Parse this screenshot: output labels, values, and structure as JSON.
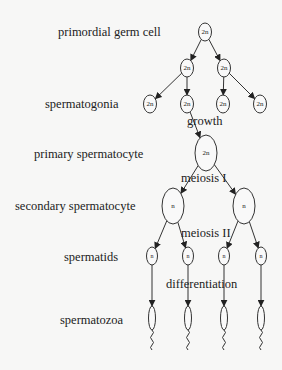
{
  "diagram": {
    "stage_labels": [
      {
        "id": "primordial",
        "text": "primordial germ cell"
      },
      {
        "id": "spermatogonia",
        "text": "spermatogonia"
      },
      {
        "id": "primary",
        "text": "primary spermatocyte"
      },
      {
        "id": "secondary",
        "text": "secondary spermatocyte"
      },
      {
        "id": "spermatids",
        "text": "spermatids"
      },
      {
        "id": "spermatozoa",
        "text": "spermatozoa"
      }
    ],
    "process_labels": [
      {
        "id": "growth",
        "text": "growth"
      },
      {
        "id": "meiosis1",
        "text": "meiosis I"
      },
      {
        "id": "meiosis2",
        "text": "meiosis II"
      },
      {
        "id": "differentiation",
        "text": "differentiation"
      }
    ],
    "nodes": [
      {
        "id": "pgc",
        "stage": "primordial",
        "ploidy": "2n"
      },
      {
        "id": "g1",
        "stage": "spermatogonia-intermediate",
        "ploidy": "2n"
      },
      {
        "id": "g2",
        "stage": "spermatogonia-intermediate",
        "ploidy": "2n"
      },
      {
        "id": "sg1",
        "stage": "spermatogonia",
        "ploidy": "2n"
      },
      {
        "id": "sg2",
        "stage": "spermatogonia",
        "ploidy": "2n"
      },
      {
        "id": "sg3",
        "stage": "spermatogonia",
        "ploidy": "2n"
      },
      {
        "id": "sg4",
        "stage": "spermatogonia",
        "ploidy": "2n"
      },
      {
        "id": "ps",
        "stage": "primary",
        "ploidy": "2n"
      },
      {
        "id": "ss1",
        "stage": "secondary",
        "ploidy": "n"
      },
      {
        "id": "ss2",
        "stage": "secondary",
        "ploidy": "n"
      },
      {
        "id": "st1",
        "stage": "spermatids",
        "ploidy": "n"
      },
      {
        "id": "st2",
        "stage": "spermatids",
        "ploidy": "n"
      },
      {
        "id": "st3",
        "stage": "spermatids",
        "ploidy": "n"
      },
      {
        "id": "st4",
        "stage": "spermatids",
        "ploidy": "n"
      },
      {
        "id": "sz1",
        "stage": "spermatozoa",
        "ploidy": ""
      },
      {
        "id": "sz2",
        "stage": "spermatozoa",
        "ploidy": ""
      },
      {
        "id": "sz3",
        "stage": "spermatozoa",
        "ploidy": ""
      },
      {
        "id": "sz4",
        "stage": "spermatozoa",
        "ploidy": ""
      }
    ],
    "edges": [
      {
        "from": "pgc",
        "to": "g1"
      },
      {
        "from": "pgc",
        "to": "g2"
      },
      {
        "from": "g1",
        "to": "sg1"
      },
      {
        "from": "g1",
        "to": "sg2"
      },
      {
        "from": "g2",
        "to": "sg3"
      },
      {
        "from": "g2",
        "to": "sg4"
      },
      {
        "from": "sg2",
        "to": "ps",
        "label": "growth"
      },
      {
        "from": "ps",
        "to": "ss1",
        "label": "meiosis I"
      },
      {
        "from": "ps",
        "to": "ss2",
        "label": "meiosis I"
      },
      {
        "from": "ss1",
        "to": "st1",
        "label": "meiosis II"
      },
      {
        "from": "ss1",
        "to": "st2",
        "label": "meiosis II"
      },
      {
        "from": "ss2",
        "to": "st3",
        "label": "meiosis II"
      },
      {
        "from": "ss2",
        "to": "st4",
        "label": "meiosis II"
      },
      {
        "from": "st1",
        "to": "sz1",
        "label": "differentiation"
      },
      {
        "from": "st2",
        "to": "sz2",
        "label": "differentiation"
      },
      {
        "from": "st3",
        "to": "sz3",
        "label": "differentiation"
      },
      {
        "from": "st4",
        "to": "sz4",
        "label": "differentiation"
      }
    ]
  }
}
